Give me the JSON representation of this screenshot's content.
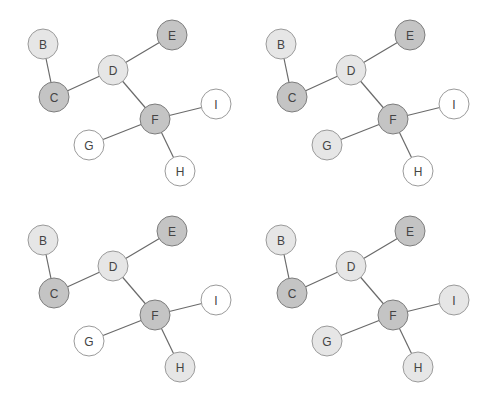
{
  "diagram": {
    "title": "",
    "colors": {
      "dark": "#c4c4c4",
      "light": "#e6e6e6",
      "white": "#ffffff",
      "edge": "#6a6a6a"
    },
    "nodes": [
      "B",
      "C",
      "D",
      "E",
      "F",
      "G",
      "H",
      "I"
    ],
    "edges": [
      [
        "B",
        "C"
      ],
      [
        "C",
        "D"
      ],
      [
        "D",
        "E"
      ],
      [
        "D",
        "F"
      ],
      [
        "F",
        "G"
      ],
      [
        "F",
        "H"
      ],
      [
        "F",
        "I"
      ]
    ],
    "panels": [
      {
        "id": "top-left",
        "states": {
          "B": "light",
          "C": "dark",
          "D": "light",
          "E": "dark",
          "F": "dark",
          "G": "white",
          "H": "white",
          "I": "white"
        }
      },
      {
        "id": "top-right",
        "states": {
          "B": "light",
          "C": "dark",
          "D": "light",
          "E": "dark",
          "F": "dark",
          "G": "light",
          "H": "white",
          "I": "white"
        }
      },
      {
        "id": "bottom-left",
        "states": {
          "B": "light",
          "C": "dark",
          "D": "light",
          "E": "dark",
          "F": "dark",
          "G": "white",
          "H": "light",
          "I": "white"
        }
      },
      {
        "id": "bottom-right",
        "states": {
          "B": "light",
          "C": "dark",
          "D": "light",
          "E": "dark",
          "F": "dark",
          "G": "light",
          "H": "light",
          "I": "light"
        }
      }
    ]
  }
}
